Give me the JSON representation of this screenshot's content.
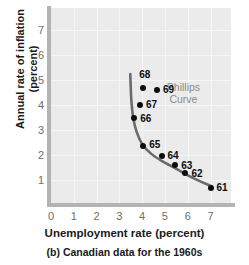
{
  "chart_data": {
    "type": "scatter",
    "title": "",
    "caption": "(b) Canadian data for the 1960s",
    "xlabel": "Unemployment rate (percent)",
    "ylabel": "Annual rate of inflation (percent)",
    "ylabel_line1": "Annual rate of inflation",
    "ylabel_line2": "(percent)",
    "xlim": [
      0,
      7.9
    ],
    "ylim": [
      0,
      7.9
    ],
    "xticks": [
      0,
      1,
      2,
      3,
      4,
      5,
      6,
      7
    ],
    "xtick_labels": [
      "0",
      "1",
      "2",
      "3",
      "4",
      "5",
      "6",
      "7"
    ],
    "yticks": [
      1,
      2,
      3,
      4,
      5,
      6,
      7
    ],
    "ytick_labels": [
      "1",
      "2",
      "3",
      "4",
      "5",
      "6",
      "7"
    ],
    "grid": true,
    "legend": "none",
    "annotations": [
      {
        "text": "Phillips\nCurve",
        "line1": "Phillips",
        "line2": "Curve",
        "x": 6.05,
        "y": 4.75
      }
    ],
    "points": [
      {
        "label": "61",
        "x": 7.0,
        "y": 0.7,
        "label_dx": 6,
        "label_dy": 0
      },
      {
        "label": "62",
        "x": 5.9,
        "y": 1.3,
        "label_dx": 6,
        "label_dy": 1
      },
      {
        "label": "63",
        "x": 5.45,
        "y": 1.6,
        "label_dx": 6,
        "label_dy": 1
      },
      {
        "label": "64",
        "x": 4.85,
        "y": 1.95,
        "label_dx": 6,
        "label_dy": 0
      },
      {
        "label": "65",
        "x": 4.05,
        "y": 2.35,
        "label_dx": 6,
        "label_dy": -1
      },
      {
        "label": "66",
        "x": 3.65,
        "y": 3.5,
        "label_dx": 6,
        "label_dy": 1
      },
      {
        "label": "67",
        "x": 3.9,
        "y": 4.0,
        "label_dx": 6,
        "label_dy": 0
      },
      {
        "label": "68",
        "x": 4.05,
        "y": 4.7,
        "label_dx": -4,
        "label_dy": -13
      },
      {
        "label": "69",
        "x": 4.65,
        "y": 4.6,
        "label_dx": 6,
        "label_dy": 0
      }
    ],
    "curve": {
      "name": "Phillips Curve",
      "color": "#6b6b6b",
      "points": [
        {
          "x": 3.48,
          "y": 5.25
        },
        {
          "x": 3.52,
          "y": 4.3
        },
        {
          "x": 3.6,
          "y": 3.55
        },
        {
          "x": 3.75,
          "y": 2.95
        },
        {
          "x": 4.0,
          "y": 2.45
        },
        {
          "x": 4.4,
          "y": 2.05
        },
        {
          "x": 4.9,
          "y": 1.75
        },
        {
          "x": 5.5,
          "y": 1.45
        },
        {
          "x": 6.2,
          "y": 1.1
        },
        {
          "x": 7.05,
          "y": 0.75
        }
      ]
    },
    "colors": {
      "plot_background": "#ebebeb",
      "gridline": "#f6f6f6",
      "axis": "#b3b3b3",
      "tick_label": "#6d6d6d",
      "point": "#0d0d0d",
      "curve": "#6b6b6b",
      "annotation": "#8c8c8c",
      "title_text": "#1a1a1a"
    }
  }
}
